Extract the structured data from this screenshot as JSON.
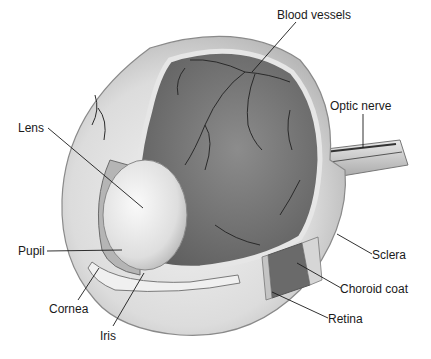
{
  "figure": {
    "labels": [
      {
        "id": "blood-vessels",
        "text": "Blood vessels",
        "x": 277,
        "y": 8,
        "line": [
          296,
          22,
          252,
          72
        ]
      },
      {
        "id": "optic-nerve",
        "text": "Optic nerve",
        "x": 330,
        "y": 99,
        "line": [
          363,
          114,
          363,
          148
        ]
      },
      {
        "id": "lens",
        "text": "Lens",
        "x": 18,
        "y": 121,
        "line": [
          48,
          128,
          143,
          208
        ]
      },
      {
        "id": "pupil",
        "text": "Pupil",
        "x": 18,
        "y": 244,
        "line": [
          47,
          251,
          122,
          250
        ]
      },
      {
        "id": "cornea",
        "text": "Cornea",
        "x": 49,
        "y": 302,
        "line": [
          78,
          300,
          99,
          268
        ]
      },
      {
        "id": "iris",
        "text": "Iris",
        "x": 100,
        "y": 329,
        "line": [
          113,
          326,
          144,
          273
        ]
      },
      {
        "id": "sclera",
        "text": "Sclera",
        "x": 372,
        "y": 248,
        "line": [
          372,
          254,
          337,
          234
        ]
      },
      {
        "id": "choroid-coat",
        "text": "Choroid coat",
        "x": 340,
        "y": 282,
        "line": [
          341,
          288,
          297,
          263
        ]
      },
      {
        "id": "retina",
        "text": "Retina",
        "x": 328,
        "y": 312,
        "line": [
          328,
          318,
          272,
          292
        ]
      }
    ]
  }
}
